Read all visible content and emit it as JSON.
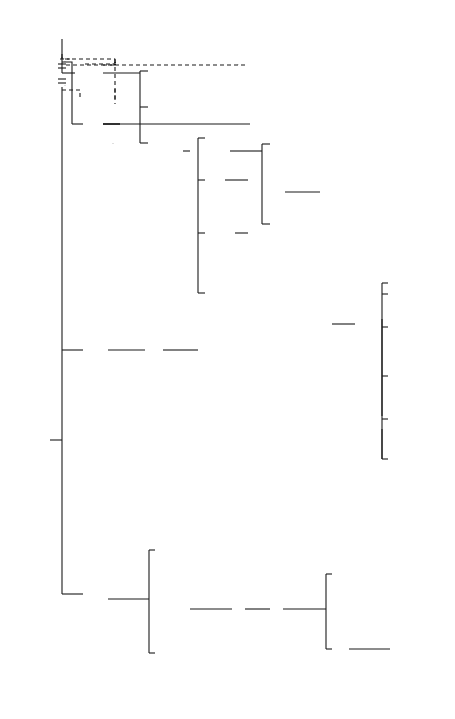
{
  "caption": "24. Earls of Orkney, c.1065–1230.",
  "people": {
    "macbeth": {
      "l1": "Macbeth",
      "l2": "King of",
      "l3": "Scots",
      "l4": "1040–1057"
    },
    "ingebjorg_m": {
      "l1": "Ingebjorg m.",
      "mark": "(1)"
    },
    "malcolm_canmore": {
      "l1": "Malcolm Canmore m St Margaret",
      "l2": "King of Scots",
      "l3": "1057–1093",
      "mark": "(2)"
    },
    "thorfinn": {
      "l1": "Thorfinn",
      "l2": "1014–c. 1065"
    },
    "maelmuire": {
      "l1": "Maelmuire"
    },
    "paul1": {
      "l1": "Paul I",
      "l2": "c. 1065–1098"
    },
    "erlend2": {
      "l1": "Erlend II",
      "l2": "c. 1065–1098"
    },
    "magnus": {
      "l1": "Magnus",
      "l2": "c. 1105–1115"
    },
    "gunnhild": {
      "l1": "Gunnhild m. Kol Kalisson"
    },
    "rognvald": {
      "l1": "Rognvald",
      "l2": "1136–1158"
    },
    "ingirid": {
      "l1": "Ingirid"
    },
    "harald_younger": {
      "l1": "Harald the",
      "l2": "Younger",
      "l3": "killed 1198"
    },
    "ragnhild": {
      "l1": "Ragnhild"
    },
    "snaekoll": {
      "l1": "Snaekoll",
      "l2": "Gunnason"
    },
    "hakon": {
      "l1": "Hakon",
      "l2": "c. 1103–c. 1123"
    },
    "maddad": {
      "l1": "Maddad",
      "l2": "Earl of Atholl m. Margaret"
    },
    "ingebjorg2": {
      "l1": "Ingebjorg"
    },
    "harald1": {
      "l1": "Harald I",
      "l2": "c. 1123"
    },
    "paul2": {
      "l1": "Paul II",
      "l2": "c. 1123–1136"
    },
    "gudrod": {
      "l1": "Gudrod",
      "l2": "King of Man"
    },
    "erlend3": {
      "l1": "Erlend III",
      "l2": "1151–1154"
    },
    "rognvald_man": {
      "l1": "Rognvald",
      "l2": "King of Man"
    },
    "edgar": {
      "l1": "Edgar",
      "l2": "King of Scots",
      "l3": "1097–1107"
    },
    "alexander1": {
      "l1": "Alexander I",
      "l2": "King of Scots",
      "l3": "1107–1124"
    },
    "david1": {
      "l1": "David I",
      "l2": "King of Scots",
      "l3": "1124–1153"
    },
    "henry_scot": {
      "l1": "Henry"
    },
    "malcolm4": {
      "l1": "Malcolm IV",
      "l2": "King of Scots",
      "l3": "1153–1165"
    },
    "william_lion": {
      "l1": "William the Lion",
      "l2": "King of Scots",
      "l3": "1165–1214"
    },
    "harald_m": {
      "l1": "Harald",
      "l2": "Maddadsson",
      "l3": "1138–1206",
      "l4": "m. (1) Afreka",
      "l5": "(2) Hvarflod"
    },
    "moray": {
      "l1": "Moray Claimants",
      "l2": "Bishop Wimund",
      "l3": "MacWilliams"
    },
    "hakon_k": {
      "l1": "Hakon",
      "l2": "killed with Sweyn",
      "l3": "Asleifsson in",
      "l4": "Ireland"
    },
    "thorfinn_m": {
      "l1": "Thorfinn",
      "l2": "mutilated by",
      "l3": "William the Lion"
    },
    "john": {
      "l1": "John",
      "l2": "1206–1230"
    },
    "david_e": {
      "l1": "David",
      "l2": "1206–1214"
    },
    "henry_ross": {
      "l1": "Henry",
      "l2": "inherited land",
      "l3": "in Ross"
    },
    "olaf": {
      "l1": "? m.  Olaf Jarlsmágr",
      "l2": "killed at Florvåg"
    }
  }
}
